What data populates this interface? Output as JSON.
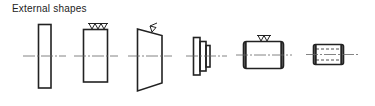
{
  "title": "External shapes",
  "colors": {
    "stroke": "#222222",
    "centerline": "#555555",
    "background": "#ffffff"
  },
  "shapes": [
    {
      "name": "thin-disc",
      "description": "tall narrow rectangle, no surface symbol"
    },
    {
      "name": "rectangular-block-machined",
      "description": "rectangle with three machining triangles on top edge",
      "surface_symbol": "triple-triangle"
    },
    {
      "name": "tapered-block",
      "description": "trapezoid with single surface symbol on sloped top",
      "surface_symbol": "single-triangle-check"
    },
    {
      "name": "stepped-shaft",
      "description": "three stepped rectangles decreasing in height"
    },
    {
      "name": "cylinder-chamfered",
      "description": "horizontal cylinder with rounded/chamfered ends and double-triangle symbol on top",
      "surface_symbol": "double-triangle"
    },
    {
      "name": "hollow-cylinder",
      "description": "short horizontal cylinder with dashed hidden bore lines"
    }
  ]
}
